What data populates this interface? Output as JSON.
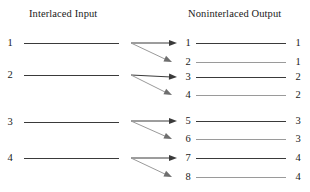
{
  "titles": {
    "input": "Interlaced Input",
    "output": "Noninterlaced Output"
  },
  "colors": {
    "line_dark": "#3a3a3a",
    "line_light": "#9a9a9a",
    "text": "#1a1a1a",
    "background": "#ffffff"
  },
  "input_rows": [
    {
      "label": "1",
      "y": 43
    },
    {
      "label": "2",
      "y": 75
    },
    {
      "label": "3",
      "y": 122
    },
    {
      "label": "4",
      "y": 158
    }
  ],
  "output_rows": [
    {
      "left_label": "1",
      "right_label": "1",
      "y": 43,
      "shade": "dark"
    },
    {
      "left_label": "2",
      "right_label": "1",
      "y": 62,
      "shade": "light"
    },
    {
      "left_label": "3",
      "right_label": "2",
      "y": 77,
      "shade": "dark"
    },
    {
      "left_label": "4",
      "right_label": "2",
      "y": 95,
      "shade": "light"
    },
    {
      "left_label": "5",
      "right_label": "3",
      "y": 121,
      "shade": "dark"
    },
    {
      "left_label": "6",
      "right_label": "3",
      "y": 139,
      "shade": "light"
    },
    {
      "left_label": "7",
      "right_label": "4",
      "y": 158,
      "shade": "dark"
    },
    {
      "left_label": "8",
      "right_label": "4",
      "y": 177,
      "shade": "light"
    }
  ],
  "arrow_groups": [
    {
      "origin_x": 131,
      "origin_y": 43,
      "straight_to_x": 177,
      "straight_to_y": 43,
      "slant_to_x": 172,
      "slant_to_y": 62
    },
    {
      "origin_x": 131,
      "origin_y": 75,
      "straight_to_x": 177,
      "straight_to_y": 77,
      "slant_to_x": 172,
      "slant_to_y": 95
    },
    {
      "origin_x": 131,
      "origin_y": 121,
      "straight_to_x": 177,
      "straight_to_y": 121,
      "slant_to_x": 172,
      "slant_to_y": 139
    },
    {
      "origin_x": 131,
      "origin_y": 158,
      "straight_to_x": 177,
      "straight_to_y": 158,
      "slant_to_x": 172,
      "slant_to_y": 177
    }
  ]
}
